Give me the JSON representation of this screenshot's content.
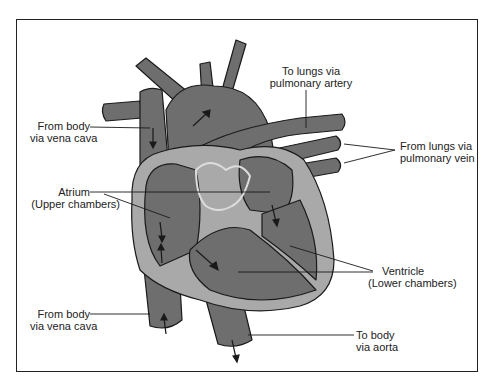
{
  "diagram": {
    "colors": {
      "vessel": "#6e6e6e",
      "wall": "#a9a9a9",
      "outline": "#1a1a1a",
      "background": "#ffffff"
    },
    "labels": {
      "vena_cava_upper": {
        "line1": "From body",
        "line2": "via vena cava"
      },
      "pulmonary_artery": {
        "line1": "To lungs via",
        "line2": "pulmonary artery"
      },
      "pulmonary_vein": {
        "line1": "From lungs via",
        "line2": "pulmonary vein"
      },
      "atrium": {
        "line1": "Atrium",
        "line2": "(Upper chambers)"
      },
      "ventricle": {
        "line1": "Ventricle",
        "line2": "(Lower chambers)"
      },
      "vena_cava_lower": {
        "line1": "From body",
        "line2": "via vena cava"
      },
      "aorta": {
        "line1": "To body",
        "line2": "via aorta"
      }
    }
  }
}
